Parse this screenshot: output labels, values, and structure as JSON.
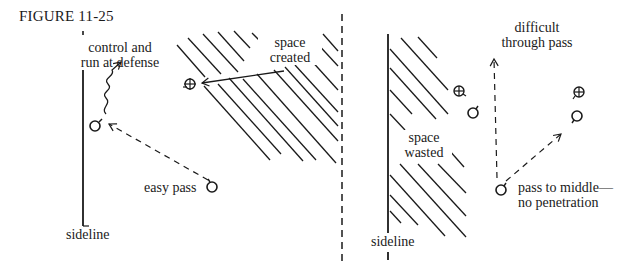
{
  "figure": {
    "title": "FIGURE 11-25"
  },
  "left_panel": {
    "labels": {
      "control_line1": "control and",
      "control_line2": "run at defense",
      "space_created_line1": "space",
      "space_created_line2": "created",
      "easy_pass": "easy pass",
      "sideline": "sideline"
    },
    "players": [
      {
        "role": "attacker",
        "symbol": "circle-with-stem",
        "x": 95,
        "y": 125
      },
      {
        "role": "attacker",
        "symbol": "circle-with-stem",
        "x": 212,
        "y": 186
      },
      {
        "role": "defender",
        "symbol": "circled-cross",
        "x": 190,
        "y": 83
      }
    ]
  },
  "right_panel": {
    "labels": {
      "difficult_line1": "difficult",
      "difficult_line2": "through pass",
      "space_wasted_line1": "space",
      "space_wasted_line2": "wasted",
      "pass_middle_line1": "pass to middle—",
      "pass_middle_line2": "no penetration",
      "sideline": "sideline"
    },
    "players": [
      {
        "role": "defender",
        "symbol": "circled-cross",
        "x": 459,
        "y": 91
      },
      {
        "role": "attacker",
        "symbol": "circle-with-stem",
        "x": 473,
        "y": 112
      },
      {
        "role": "defender",
        "symbol": "circled-cross",
        "x": 579,
        "y": 92
      },
      {
        "role": "attacker",
        "symbol": "circle-with-stem",
        "x": 576,
        "y": 116
      },
      {
        "role": "attacker",
        "symbol": "circle-with-stem",
        "x": 501,
        "y": 189
      }
    ]
  },
  "legend_symbols": {
    "attacker": "circle-with-stem",
    "defender": "circled-cross",
    "pass": "dashed-arrow",
    "dribble": "wavy-arrow",
    "movement": "solid-arrow"
  }
}
